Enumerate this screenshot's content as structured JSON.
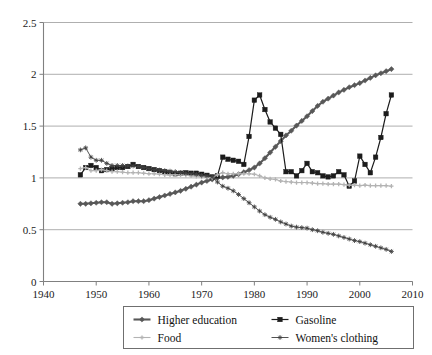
{
  "chart_data": {
    "type": "line",
    "title": "",
    "subtitle": "",
    "xlabel": "",
    "ylabel": "",
    "xlim": [
      1940,
      2010
    ],
    "ylim": [
      0,
      2.5
    ],
    "xticks": [
      1940,
      1950,
      1960,
      1970,
      1980,
      1990,
      2000,
      2010
    ],
    "yticks": [
      0,
      0.5,
      1,
      1.5,
      2,
      2.5
    ],
    "xtick_labels": [
      "1940",
      "1950",
      "1960",
      "1970",
      "1980",
      "1990",
      "2000",
      "2010"
    ],
    "ytick_labels": [
      "0",
      "0.5",
      "1",
      "1.5",
      "2",
      "2.5"
    ],
    "grid": "horizontal",
    "legend_position": "bottom",
    "x": [
      1947,
      1948,
      1949,
      1950,
      1951,
      1952,
      1953,
      1954,
      1955,
      1956,
      1957,
      1958,
      1959,
      1960,
      1961,
      1962,
      1963,
      1964,
      1965,
      1966,
      1967,
      1968,
      1969,
      1970,
      1971,
      1972,
      1973,
      1974,
      1975,
      1976,
      1977,
      1978,
      1979,
      1980,
      1981,
      1982,
      1983,
      1984,
      1985,
      1986,
      1987,
      1988,
      1989,
      1990,
      1991,
      1992,
      1993,
      1994,
      1995,
      1996,
      1997,
      1998,
      1999,
      2000,
      2001,
      2002,
      2003,
      2004,
      2005,
      2006
    ],
    "series": [
      {
        "name": "Higher education",
        "color": "#585858",
        "marker": "diamond",
        "values": [
          0.75,
          0.75,
          0.755,
          0.76,
          0.765,
          0.765,
          0.75,
          0.755,
          0.76,
          0.765,
          0.775,
          0.775,
          0.775,
          0.785,
          0.8,
          0.815,
          0.83,
          0.845,
          0.86,
          0.875,
          0.895,
          0.915,
          0.935,
          0.955,
          0.97,
          0.985,
          1.0,
          1.005,
          1.01,
          1.02,
          1.035,
          1.055,
          1.075,
          1.1,
          1.14,
          1.19,
          1.245,
          1.3,
          1.355,
          1.41,
          1.455,
          1.505,
          1.55,
          1.595,
          1.645,
          1.695,
          1.735,
          1.765,
          1.795,
          1.825,
          1.85,
          1.875,
          1.895,
          1.915,
          1.94,
          1.965,
          1.99,
          2.01,
          2.03,
          2.05
        ]
      },
      {
        "name": "Gasoline",
        "color": "#1c1c1c",
        "marker": "square",
        "values": [
          1.03,
          1.1,
          1.12,
          1.1,
          1.07,
          1.08,
          1.09,
          1.1,
          1.1,
          1.11,
          1.13,
          1.11,
          1.1,
          1.09,
          1.08,
          1.07,
          1.06,
          1.05,
          1.04,
          1.045,
          1.05,
          1.045,
          1.045,
          1.035,
          1.025,
          1.01,
          1.02,
          1.2,
          1.18,
          1.17,
          1.16,
          1.13,
          1.4,
          1.75,
          1.8,
          1.66,
          1.54,
          1.48,
          1.42,
          1.06,
          1.06,
          1.02,
          1.07,
          1.14,
          1.06,
          1.05,
          1.02,
          1.01,
          1.02,
          1.06,
          1.03,
          0.92,
          0.97,
          1.21,
          1.13,
          1.05,
          1.2,
          1.39,
          1.62,
          1.8
        ]
      },
      {
        "name": "Food",
        "color": "#b3b3b3",
        "marker": "cross",
        "values": [
          1.09,
          1.1,
          1.07,
          1.07,
          1.08,
          1.07,
          1.06,
          1.06,
          1.055,
          1.05,
          1.05,
          1.05,
          1.045,
          1.04,
          1.04,
          1.035,
          1.03,
          1.03,
          1.03,
          1.03,
          1.025,
          1.02,
          1.015,
          1.01,
          1.005,
          1.0,
          1.03,
          1.05,
          1.04,
          1.04,
          1.04,
          1.04,
          1.04,
          1.035,
          1.02,
          1.0,
          0.99,
          0.985,
          0.97,
          0.965,
          0.96,
          0.955,
          0.955,
          0.955,
          0.95,
          0.945,
          0.945,
          0.94,
          0.94,
          0.94,
          0.935,
          0.93,
          0.93,
          0.925,
          0.93,
          0.925,
          0.925,
          0.925,
          0.925,
          0.92
        ]
      },
      {
        "name": "Women's clothing",
        "color": "#404040",
        "marker": "star",
        "values": [
          1.27,
          1.29,
          1.2,
          1.17,
          1.17,
          1.14,
          1.12,
          1.12,
          1.12,
          1.115,
          1.115,
          1.11,
          1.1,
          1.09,
          1.08,
          1.075,
          1.07,
          1.065,
          1.06,
          1.05,
          1.045,
          1.04,
          1.035,
          1.025,
          1.02,
          1.01,
          0.96,
          0.92,
          0.9,
          0.875,
          0.84,
          0.8,
          0.76,
          0.72,
          0.68,
          0.645,
          0.62,
          0.6,
          0.575,
          0.555,
          0.535,
          0.525,
          0.52,
          0.515,
          0.5,
          0.49,
          0.475,
          0.465,
          0.455,
          0.44,
          0.425,
          0.41,
          0.395,
          0.385,
          0.37,
          0.355,
          0.34,
          0.325,
          0.31,
          0.29
        ]
      }
    ]
  },
  "legend": {
    "entries": [
      {
        "label": "Higher education"
      },
      {
        "label": "Gasoline"
      },
      {
        "label": "Food"
      },
      {
        "label": "Women's clothing"
      }
    ]
  },
  "colors": {
    "background": "#ffffff",
    "gridline": "#9a9a9a",
    "axis": "#808080",
    "text": "#1a1a1a",
    "legend_border": "#6f6f6f"
  }
}
